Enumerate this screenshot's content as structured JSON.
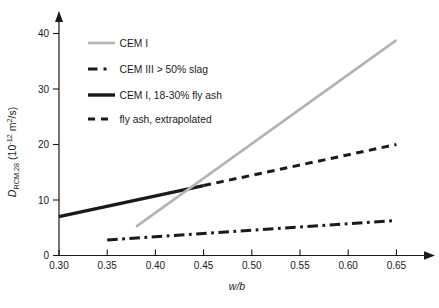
{
  "figure": {
    "background": "#ffffff",
    "axis_color": "#1a1a1a",
    "gray_accent": "#b4b4b4"
  },
  "chart_data": {
    "type": "line",
    "title": "",
    "xlabel": "w/b",
    "ylabel": "D_RCM,28 (10^-12 m^2/s)",
    "ylabel_parts": [
      {
        "text": "D",
        "italic": true
      },
      {
        "text": "RCM,28",
        "script": "sub"
      },
      {
        "text": " (10",
        "script": "normal"
      },
      {
        "text": "-12",
        "script": "sup"
      },
      {
        "text": " m",
        "script": "normal"
      },
      {
        "text": "2",
        "script": "sup"
      },
      {
        "text": "/s)",
        "script": "normal"
      }
    ],
    "xlim": [
      0.3,
      0.65
    ],
    "ylim": [
      0,
      40
    ],
    "grid": false,
    "x_tick_values": [
      0.3,
      0.35,
      0.4,
      0.45,
      0.5,
      0.55,
      0.6,
      0.65
    ],
    "x_tick_labels": [
      "0.30",
      "0.35",
      "0.40",
      "0.45",
      "0.50",
      "0.55",
      "0.60",
      "0.65"
    ],
    "y_tick_values": [
      0,
      10,
      20,
      30,
      40
    ],
    "y_tick_labels": [
      "0",
      "10",
      "20",
      "30",
      "40"
    ],
    "legend_position": "upper-left",
    "series": [
      {
        "name": "CEM I",
        "color": "#b4b4b4",
        "line_style": "solid",
        "line_width": 2.6,
        "points": [
          [
            0.38,
            5.2
          ],
          [
            0.65,
            38.8
          ]
        ]
      },
      {
        "name": "CEM III > 50% slag",
        "color": "#1a1a1a",
        "line_style": "dash-dot",
        "line_width": 3.0,
        "points": [
          [
            0.35,
            2.8
          ],
          [
            0.65,
            6.3
          ]
        ]
      },
      {
        "name": "CEM I, 18-30% fly ash",
        "color": "#1a1a1a",
        "line_style": "solid",
        "line_width": 3.4,
        "points": [
          [
            0.3,
            7.0
          ],
          [
            0.45,
            12.6
          ]
        ]
      },
      {
        "name": "fly ash, extrapolated",
        "color": "#1a1a1a",
        "line_style": "dashed",
        "line_width": 3.0,
        "points": [
          [
            0.45,
            12.6
          ],
          [
            0.65,
            20.0
          ]
        ]
      }
    ]
  }
}
